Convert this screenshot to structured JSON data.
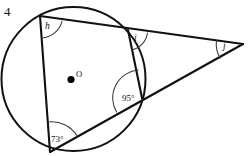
{
  "figure": {
    "problem_number": "4",
    "center_label": "O",
    "labels": {
      "angle_h": "h",
      "angle_i": "i",
      "angle_j": "j",
      "angle_95": "95°",
      "angle_73": "73°"
    },
    "colors": {
      "stroke": "#111111",
      "arc_stroke": "#3a3a3a",
      "background": "#ffffff"
    },
    "geometry": {
      "circle": {
        "cx": 73.5,
        "cy": 79,
        "r": 72
      },
      "points": {
        "top_left": {
          "x": 40,
          "y": 16
        },
        "top_right": {
          "x": 128,
          "y": 30
        },
        "bottom_left": {
          "x": 50,
          "y": 152
        },
        "right_chord": {
          "x": 142,
          "y": 98
        },
        "apex": {
          "x": 243,
          "y": 44
        }
      },
      "segments": [
        {
          "name": "top-left-to-apex",
          "from": "top_left",
          "to": "apex"
        },
        {
          "name": "top-left-to-bottom-left",
          "from": "top_left",
          "to": "bottom_left"
        },
        {
          "name": "bottom-left-to-apex",
          "from": "bottom_left",
          "to": "apex"
        },
        {
          "name": "top-right-to-right-chord",
          "from": "top_right",
          "to": "right_chord"
        }
      ]
    }
  }
}
